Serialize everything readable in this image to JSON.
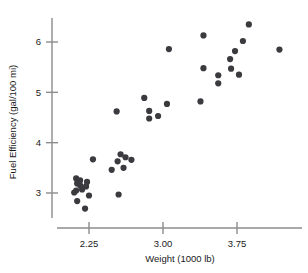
{
  "chart_data": {
    "type": "scatter",
    "title": "",
    "xlabel": "Weight (1000 lb)",
    "ylabel": "Fuel Efficiency (gal/100 mi)",
    "xlim": [
      2.03,
      4.23
    ],
    "ylim": [
      2.53,
      6.53
    ],
    "xticks": [
      2.25,
      3.0,
      3.75
    ],
    "xticklabels": [
      "2.25",
      "3.00",
      "3.75"
    ],
    "yticks": [
      3,
      4,
      5,
      6
    ],
    "yticklabels": [
      "3",
      "4",
      "5",
      "6"
    ],
    "grid": false,
    "legend": null,
    "marker": "circle",
    "marker_color": "#3a3a3f",
    "marker_size": 3.1,
    "points": [
      {
        "x": 2.1,
        "y": 3.01
      },
      {
        "x": 2.13,
        "y": 2.84
      },
      {
        "x": 2.18,
        "y": 3.07
      },
      {
        "x": 2.16,
        "y": 3.15
      },
      {
        "x": 2.22,
        "y": 3.13
      },
      {
        "x": 2.21,
        "y": 2.69
      },
      {
        "x": 2.25,
        "y": 2.95
      },
      {
        "x": 2.13,
        "y": 3.19
      },
      {
        "x": 2.12,
        "y": 3.05
      },
      {
        "x": 2.12,
        "y": 3.29
      },
      {
        "x": 2.16,
        "y": 3.25
      },
      {
        "x": 2.23,
        "y": 3.22
      },
      {
        "x": 2.29,
        "y": 3.67
      },
      {
        "x": 2.48,
        "y": 3.46
      },
      {
        "x": 2.55,
        "y": 2.97
      },
      {
        "x": 2.54,
        "y": 3.63
      },
      {
        "x": 2.57,
        "y": 3.77
      },
      {
        "x": 2.6,
        "y": 3.5
      },
      {
        "x": 2.62,
        "y": 3.71
      },
      {
        "x": 2.68,
        "y": 3.66
      },
      {
        "x": 2.53,
        "y": 4.62
      },
      {
        "x": 2.81,
        "y": 4.89
      },
      {
        "x": 2.86,
        "y": 4.63
      },
      {
        "x": 2.86,
        "y": 4.48
      },
      {
        "x": 2.95,
        "y": 4.53
      },
      {
        "x": 3.06,
        "y": 5.86
      },
      {
        "x": 3.04,
        "y": 4.77
      },
      {
        "x": 3.41,
        "y": 6.13
      },
      {
        "x": 3.41,
        "y": 5.48
      },
      {
        "x": 3.38,
        "y": 4.82
      },
      {
        "x": 3.56,
        "y": 5.18
      },
      {
        "x": 3.56,
        "y": 5.34
      },
      {
        "x": 3.68,
        "y": 5.66
      },
      {
        "x": 3.73,
        "y": 5.82
      },
      {
        "x": 3.69,
        "y": 5.47
      },
      {
        "x": 3.77,
        "y": 5.35
      },
      {
        "x": 3.81,
        "y": 6.02
      },
      {
        "x": 3.87,
        "y": 6.35
      },
      {
        "x": 4.18,
        "y": 5.85
      }
    ]
  }
}
